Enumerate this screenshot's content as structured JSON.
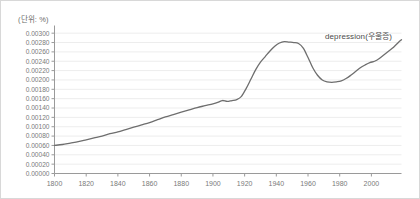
{
  "unit_label": "(단위: %)",
  "annotation": {
    "label": "depression(우울증)",
    "x": 324,
    "y": 29
  },
  "colors": {
    "line": "#6e6e6e",
    "grid": "#ededed",
    "axis": "#9a9a9a",
    "tick_text": "#7a7a7a",
    "annotation_text": "#4a4a4a",
    "background": "#ffffff",
    "border": "#d8d8d8"
  },
  "chart_data": {
    "type": "line",
    "title": "",
    "xlabel": "",
    "ylabel": "",
    "unit": "(단위: %)",
    "grid": true,
    "legend_position": "inline-right",
    "xlim": [
      1800,
      2019
    ],
    "ylim": [
      0.0,
      0.0031
    ],
    "xticks": [
      1800,
      1820,
      1840,
      1860,
      1880,
      1900,
      1920,
      1940,
      1960,
      1980,
      2000
    ],
    "yticks": [
      0.0,
      0.0002,
      0.0004,
      0.0006,
      0.0008,
      0.001,
      0.0012,
      0.0014,
      0.0016,
      0.0018,
      0.002,
      0.0022,
      0.0024,
      0.0026,
      0.0028,
      0.003
    ],
    "ytick_labels": [
      "0.00000",
      "0.00020",
      "0.00040",
      "0.00060",
      "0.00080",
      "0.00100",
      "0.00120",
      "0.00140",
      "0.00160",
      "0.00180",
      "0.00200",
      "0.00220",
      "0.00240",
      "0.00260",
      "0.00280",
      "0.00300"
    ],
    "xtick_labels": [
      "1800",
      "1820",
      "1840",
      "1860",
      "1880",
      "1900",
      "1920",
      "1940",
      "1960",
      "1980",
      "2000"
    ],
    "series": [
      {
        "name": "depression(우울증)",
        "color": "#6e6e6e",
        "x": [
          1800,
          1805,
          1810,
          1815,
          1820,
          1825,
          1830,
          1835,
          1840,
          1845,
          1850,
          1855,
          1860,
          1865,
          1870,
          1875,
          1880,
          1885,
          1890,
          1895,
          1900,
          1903,
          1906,
          1909,
          1912,
          1915,
          1918,
          1921,
          1924,
          1927,
          1930,
          1933,
          1936,
          1939,
          1942,
          1945,
          1948,
          1951,
          1954,
          1957,
          1960,
          1963,
          1966,
          1969,
          1972,
          1975,
          1978,
          1981,
          1984,
          1987,
          1990,
          1993,
          1996,
          1999,
          2002,
          2005,
          2008,
          2011,
          2014,
          2017,
          2019
        ],
        "values": [
          0.0006,
          0.00062,
          0.00065,
          0.00068,
          0.00072,
          0.00076,
          0.0008,
          0.00085,
          0.00089,
          0.00094,
          0.00099,
          0.00104,
          0.00109,
          0.00115,
          0.00121,
          0.00126,
          0.00131,
          0.00136,
          0.00141,
          0.00145,
          0.00149,
          0.00152,
          0.00156,
          0.00154,
          0.00156,
          0.00158,
          0.00165,
          0.00182,
          0.00202,
          0.00222,
          0.00238,
          0.0025,
          0.00262,
          0.00272,
          0.00279,
          0.00282,
          0.00281,
          0.0028,
          0.00278,
          0.00268,
          0.00248,
          0.00226,
          0.0021,
          0.002,
          0.00196,
          0.00195,
          0.00196,
          0.00198,
          0.00203,
          0.0021,
          0.00218,
          0.00226,
          0.00232,
          0.00237,
          0.0024,
          0.00246,
          0.00254,
          0.00262,
          0.0027,
          0.0028,
          0.00286
        ]
      }
    ]
  }
}
